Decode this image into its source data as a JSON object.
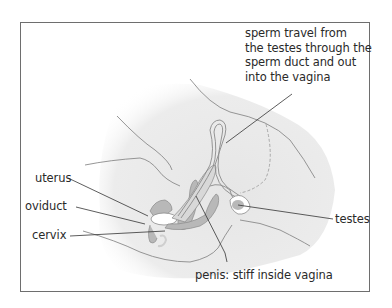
{
  "diagram": {
    "callout_lines": [
      "sperm travel from",
      "the testes through the",
      "sperm duct and out",
      "into the vagina"
    ],
    "labels": {
      "uterus": "uterus",
      "oviduct": "oviduct",
      "cervix": "cervix",
      "testes": "testes",
      "penis": "penis: stiff inside vagina"
    },
    "colors": {
      "border": "#6e6e6e",
      "body_fill": "#e9e9e9",
      "organ_fill": "#b8b8b8",
      "outline": "#7a7a7a",
      "leader": "#333333",
      "text": "#2a2a2a"
    }
  }
}
